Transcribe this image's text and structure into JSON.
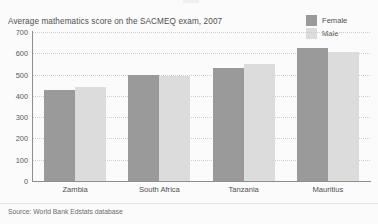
{
  "figure": {
    "background_color": "#fbfbfb",
    "source_note": "Source: World Bank Edstats database"
  },
  "legend": {
    "position": "top-right",
    "entries": [
      {
        "label": "Female",
        "color": "#9a9a9a",
        "swatch_name": "legend-swatch-female"
      },
      {
        "label": "Male",
        "color": "#dcdcdc",
        "swatch_name": "legend-swatch-male"
      }
    ]
  },
  "chart_data": {
    "type": "bar",
    "title": "Average mathematics score on the SACMEQ exam, 2007",
    "xlabel": "",
    "ylabel": "",
    "categories": [
      "Zambia",
      "South Africa",
      "Tanzania",
      "Mauritius"
    ],
    "series": [
      {
        "name": "Female",
        "color": "#9a9a9a",
        "values": [
          427,
          498,
          531,
          625
        ]
      },
      {
        "name": "Male",
        "color": "#dcdcdc",
        "values": [
          441,
          493,
          549,
          606
        ]
      }
    ],
    "ylim": [
      0,
      700
    ],
    "ytick_step": 100,
    "ytick_labels": [
      "700",
      "600",
      "500",
      "400",
      "300",
      "200",
      "100",
      "0"
    ],
    "ytick_values": [
      700,
      600,
      500,
      400,
      300,
      200,
      100,
      0
    ],
    "grid": "horizontal-dotted",
    "legend_position": "top-right",
    "source": "Source: World Bank Edstats database"
  }
}
